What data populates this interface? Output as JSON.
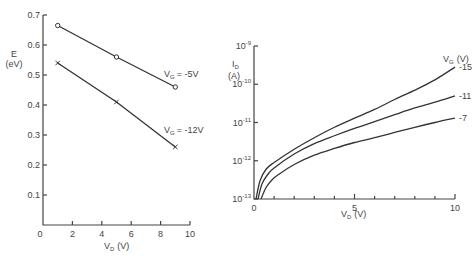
{
  "chart_data": [
    {
      "type": "line",
      "title": "",
      "xlabel": "V_D (V)",
      "ylabel": "E (eV)",
      "xlim": [
        0,
        10
      ],
      "ylim": [
        0,
        0.7
      ],
      "x_ticks": [
        "0",
        "2",
        "4",
        "6",
        "8",
        "10"
      ],
      "y_ticks": [
        "0.1",
        "0.2",
        "0.3",
        "0.4",
        "0.5",
        "0.6",
        "0.7"
      ],
      "grid": false,
      "series": [
        {
          "name": "V_G = -5V",
          "marker": "o",
          "x": [
            1,
            5,
            9
          ],
          "values": [
            0.665,
            0.56,
            0.46
          ]
        },
        {
          "name": "V_G = -12V",
          "marker": "x",
          "x": [
            1,
            5,
            9
          ],
          "values": [
            0.54,
            0.41,
            0.26
          ]
        }
      ]
    },
    {
      "type": "line",
      "title": "",
      "xlabel": "V_D (V)",
      "ylabel": "I_D (A)",
      "yscale": "log",
      "xlim": [
        0,
        10
      ],
      "ylim": [
        1e-13,
        1e-09
      ],
      "x_ticks": [
        "0",
        "5",
        "10"
      ],
      "y_ticks": [
        "10^-13",
        "10^-12",
        "10^-11",
        "10^-10",
        "10^-9"
      ],
      "grid": false,
      "legend_title": "V_G (V)",
      "series": [
        {
          "name": "-15",
          "x": [
            0.1,
            0.3,
            0.6,
            1,
            2,
            3,
            4,
            5,
            6,
            7,
            8,
            9,
            10
          ],
          "values": [
            1e-13,
            3e-13,
            6e-13,
            9e-13,
            2e-12,
            4e-12,
            7.5e-12,
            1.3e-11,
            2.2e-11,
            4e-11,
            7e-11,
            1.3e-10,
            2.8e-10
          ]
        },
        {
          "name": "-11",
          "x": [
            0.2,
            0.4,
            0.7,
            1,
            2,
            3,
            4,
            5,
            6,
            7,
            8,
            9,
            10
          ],
          "values": [
            1e-13,
            2.5e-13,
            4.5e-13,
            6.5e-13,
            1.5e-12,
            2.8e-12,
            4.5e-12,
            7e-12,
            1.05e-11,
            1.6e-11,
            2.4e-11,
            3.4e-11,
            5e-11
          ]
        },
        {
          "name": "-7",
          "x": [
            0.35,
            0.6,
            0.9,
            1.2,
            2,
            3,
            4,
            5,
            6,
            7,
            8,
            9,
            10
          ],
          "values": [
            1e-13,
            2e-13,
            3.2e-13,
            4.3e-13,
            8e-13,
            1.4e-12,
            2.1e-12,
            3e-12,
            4e-12,
            5.5e-12,
            7.5e-12,
            1e-11,
            1.3e-11
          ]
        }
      ]
    }
  ],
  "left": {
    "y_label_1": "E",
    "y_label_2": "(eV)",
    "x_label_main": "V",
    "x_label_sub": "D",
    "x_label_unit": "(V)",
    "origin": "0",
    "annot_a_main": "V",
    "annot_a_sub": "G",
    "annot_a_val": "= -5V",
    "annot_b_main": "V",
    "annot_b_sub": "G",
    "annot_b_val": "= -12V"
  },
  "right": {
    "y_label_main": "I",
    "y_label_sub": "D",
    "y_label_unit": "(A)",
    "x_label_main": "V",
    "x_label_sub": "D",
    "x_label_unit": "(V)",
    "legend_main": "V",
    "legend_sub": "G",
    "legend_unit": "(V)",
    "tick_base": "10"
  }
}
